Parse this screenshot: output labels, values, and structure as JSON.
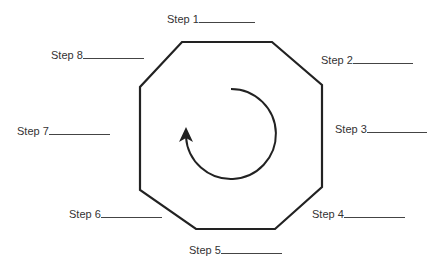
{
  "diagram": {
    "type": "cycle",
    "shape": "octagon",
    "center_arrow": "clockwise-circular-arrow",
    "stroke_color": "#222222",
    "steps": [
      {
        "label": "Step 1",
        "blank_width": 56,
        "x": 167,
        "y": 12
      },
      {
        "label": "Step 2",
        "blank_width": 60,
        "x": 321,
        "y": 53
      },
      {
        "label": "Step 3",
        "blank_width": 60,
        "x": 335,
        "y": 122
      },
      {
        "label": "Step 4",
        "blank_width": 61,
        "x": 312,
        "y": 207
      },
      {
        "label": "Step 5",
        "blank_width": 61,
        "x": 189,
        "y": 243
      },
      {
        "label": "Step 6",
        "blank_width": 61,
        "x": 69,
        "y": 207
      },
      {
        "label": "Step 7",
        "blank_width": 61,
        "x": 17,
        "y": 124
      },
      {
        "label": "Step 8",
        "blank_width": 61,
        "x": 51,
        "y": 48
      }
    ]
  }
}
